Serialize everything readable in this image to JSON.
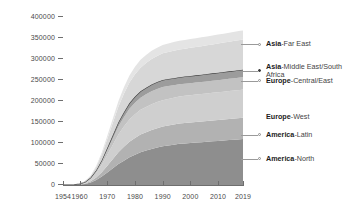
{
  "chart_data": {
    "type": "area",
    "stacked": true,
    "title": "",
    "xlabel": "",
    "ylabel": "",
    "xlim": [
      1954,
      2019
    ],
    "ylim": [
      0,
      400000
    ],
    "grid": false,
    "legend_position": "right-callouts",
    "y_ticks": [
      0,
      50000,
      100000,
      150000,
      200000,
      250000,
      300000,
      350000,
      400000
    ],
    "y_tick_labels": [
      "0",
      "50000",
      "100000",
      "150000",
      "200000",
      "250000",
      "300000",
      "350000",
      "400000"
    ],
    "x_ticks": [
      1954,
      1960,
      1970,
      1980,
      1990,
      2000,
      2010,
      2019
    ],
    "x_tick_labels": [
      "1954",
      "1960",
      "1970",
      "1980",
      "1990",
      "2000",
      "2010",
      "2019"
    ],
    "x": [
      1954,
      1956,
      1958,
      1960,
      1962,
      1964,
      1966,
      1968,
      1970,
      1972,
      1974,
      1976,
      1978,
      1980,
      1982,
      1984,
      1986,
      1988,
      1990,
      1992,
      1994,
      1996,
      1998,
      2000,
      2002,
      2004,
      2006,
      2008,
      2010,
      2012,
      2014,
      2016,
      2018,
      2019
    ],
    "series": [
      {
        "name": "America-North",
        "region": "America",
        "subregion": "North",
        "color": "#8e8e8e",
        "order": 1,
        "values": [
          0,
          0,
          300,
          900,
          2600,
          6200,
          12000,
          20000,
          30000,
          40000,
          50000,
          58000,
          66000,
          72000,
          78000,
          82000,
          86000,
          89000,
          92000,
          94000,
          96000,
          98000,
          99000,
          100000,
          101000,
          102000,
          103000,
          104000,
          105000,
          106000,
          107000,
          108000,
          109000,
          109500
        ]
      },
      {
        "name": "America-Latin",
        "region": "America",
        "subregion": "Latin",
        "color": "#b2b2b2",
        "order": 2,
        "values": [
          0,
          0,
          100,
          400,
          1200,
          3000,
          6000,
          10500,
          16000,
          22000,
          28000,
          33000,
          37000,
          40000,
          42000,
          43500,
          45000,
          46000,
          47000,
          47500,
          48000,
          48500,
          48800,
          49000,
          49200,
          49400,
          49600,
          49800,
          50000,
          50200,
          50400,
          50600,
          50800,
          50900
        ]
      },
      {
        "name": "Europe-West",
        "region": "Europe",
        "subregion": "West",
        "color": "#cfcfcf",
        "order": 3,
        "values": [
          0,
          0,
          200,
          700,
          2200,
          5200,
          10500,
          17500,
          26000,
          34000,
          42000,
          48000,
          53000,
          56500,
          59000,
          60500,
          61500,
          62500,
          63000,
          63500,
          64000,
          64200,
          64500,
          64800,
          65000,
          65200,
          65400,
          65600,
          65800,
          66000,
          66200,
          66400,
          66600,
          66700
        ]
      },
      {
        "name": "Europe-Central/East",
        "region": "Europe",
        "subregion": "Central/East",
        "color": "#c2c2c2",
        "order": 4,
        "values": [
          0,
          0,
          100,
          300,
          900,
          2200,
          4400,
          7400,
          11000,
          15000,
          19000,
          22500,
          25500,
          27500,
          29000,
          30000,
          30800,
          31200,
          31500,
          30500,
          29500,
          29000,
          28800,
          28700,
          28600,
          28600,
          28700,
          28800,
          28900,
          29000,
          29100,
          29200,
          29300,
          29350
        ]
      },
      {
        "name": "Asia-Middle East/South Africa",
        "region": "Asia",
        "subregion": "Middle East/South Africa",
        "color": "#9c9c9c",
        "order": 5,
        "boundary_line": true,
        "values": [
          0,
          0,
          50,
          150,
          450,
          1100,
          2200,
          3800,
          5800,
          8000,
          10200,
          12000,
          13500,
          14500,
          15200,
          15700,
          16000,
          16300,
          16500,
          16700,
          16900,
          17000,
          17100,
          17200,
          17300,
          17400,
          17500,
          17600,
          17700,
          17800,
          17900,
          18000,
          18100,
          18150
        ]
      },
      {
        "name": "Asia-Far East",
        "region": "Asia",
        "subregion": "Far East",
        "color": "#d7d7d7",
        "order": 6,
        "values": [
          0,
          0,
          150,
          500,
          1500,
          3800,
          7800,
          13500,
          21000,
          29000,
          37000,
          43500,
          49000,
          53000,
          56000,
          58500,
          60500,
          62000,
          63500,
          64500,
          65500,
          66000,
          66500,
          67000,
          67500,
          68000,
          68500,
          69000,
          69500,
          70000,
          70500,
          71000,
          71500,
          71800
        ]
      },
      {
        "name": "Asia-Far East (upper)",
        "region": "Asia",
        "subregion": "Far East upper",
        "color": "#e4e4e4",
        "order": 7,
        "hidden_label": true,
        "values": [
          0,
          0,
          50,
          150,
          500,
          1300,
          2800,
          4900,
          7600,
          10500,
          13200,
          15500,
          17000,
          18000,
          18800,
          19200,
          19600,
          19900,
          20100,
          20300,
          20500,
          20600,
          20700,
          20800,
          20900,
          21000,
          21100,
          21200,
          21300,
          21400,
          21500,
          21600,
          21700,
          21750
        ]
      }
    ],
    "callouts": [
      {
        "label_region": "Asia",
        "label_sub": "-Far East",
        "value_y": 335000,
        "marker": "light",
        "wrap": false
      },
      {
        "label_region": "Asia",
        "label_sub": "-Middle East/South Africa",
        "value_y": 272000,
        "marker": "dark",
        "wrap": true
      },
      {
        "label_region": "Europe",
        "label_sub": "-Central/East",
        "value_y": 248000,
        "marker": "light",
        "wrap": false
      },
      {
        "label_region": "Europe",
        "label_sub": "-West",
        "value_y": 163000,
        "marker": "none",
        "wrap": false
      },
      {
        "label_region": "America",
        "label_sub": "-Latin",
        "value_y": 120000,
        "marker": "light",
        "wrap": false
      },
      {
        "label_region": "America",
        "label_sub": "-North",
        "value_y": 62000,
        "marker": "light",
        "wrap": false
      }
    ]
  }
}
